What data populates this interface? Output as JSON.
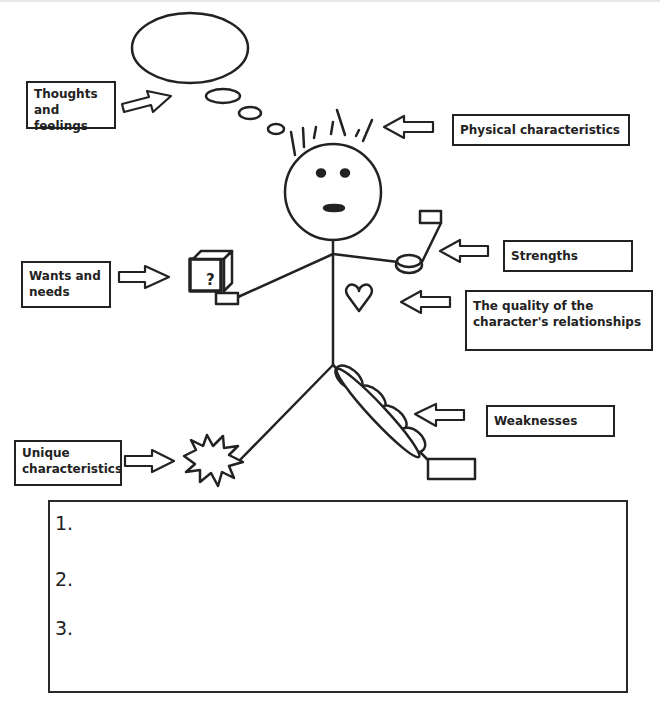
{
  "labels": {
    "thoughts": "Thoughts and feelings",
    "physical": "Physical characteristics",
    "wants": "Wants and needs",
    "strengths": "Strengths",
    "relationships": "The quality of the character's relationships",
    "weaknesses": "Weaknesses",
    "unique": "Unique characteristics"
  },
  "label_lines": {
    "thoughts": [
      "Thoughts",
      "and feelings"
    ],
    "wants": [
      "Wants and",
      "needs"
    ],
    "relationships": [
      "The quality of the",
      "character's relationships"
    ],
    "unique": [
      "Unique",
      "characteristics"
    ]
  },
  "figure": {
    "box_symbol": "?",
    "icons": [
      "thought-bubble",
      "hair-spikes",
      "face",
      "mystery-box",
      "weight-dumbbell",
      "heart",
      "peapod",
      "starburst"
    ]
  },
  "answer_box": {
    "items": [
      "1.",
      "2.",
      "3."
    ]
  },
  "colors": {
    "stroke": "#222222",
    "background": "#ffffff"
  }
}
